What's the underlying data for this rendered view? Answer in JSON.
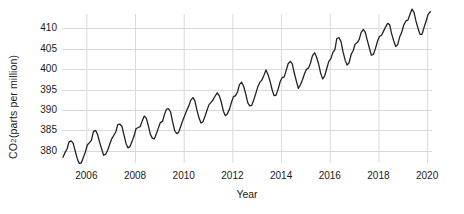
{
  "chart_data": {
    "type": "line",
    "title": "",
    "xlabel": "Year",
    "ylabel_text": "CO",
    "ylabel_sub": "2",
    "ylabel_rest": " (parts per million)",
    "ylabel_full": "CO2 (parts per million)",
    "xlim": [
      2005.0,
      2020.2
    ],
    "ylim": [
      377.0,
      413.5
    ],
    "xticks": [
      2006,
      2008,
      2010,
      2012,
      2014,
      2016,
      2018,
      2020
    ],
    "xtick_labels": [
      "2006",
      "2008",
      "2010",
      "2012",
      "2014",
      "2016",
      "2018",
      "2020"
    ],
    "yticks": [
      380,
      385,
      390,
      395,
      400,
      405,
      410
    ],
    "ytick_labels": [
      "380",
      "385",
      "390",
      "395",
      "400",
      "405",
      "410"
    ],
    "grid": true,
    "grid_color": "#d9d9d9",
    "line_color": "#222222",
    "line_width": 1.3,
    "legend": null,
    "series": [
      {
        "name": "Atmospheric CO2 monthly mean",
        "x": [
          2005.04,
          2005.13,
          2005.21,
          2005.29,
          2005.38,
          2005.46,
          2005.54,
          2005.63,
          2005.71,
          2005.79,
          2005.88,
          2005.96,
          2006.04,
          2006.13,
          2006.21,
          2006.29,
          2006.38,
          2006.46,
          2006.54,
          2006.63,
          2006.71,
          2006.79,
          2006.88,
          2006.96,
          2007.04,
          2007.13,
          2007.21,
          2007.29,
          2007.38,
          2007.46,
          2007.54,
          2007.63,
          2007.71,
          2007.79,
          2007.88,
          2007.96,
          2008.04,
          2008.13,
          2008.21,
          2008.29,
          2008.38,
          2008.46,
          2008.54,
          2008.63,
          2008.71,
          2008.79,
          2008.88,
          2008.96,
          2009.04,
          2009.13,
          2009.21,
          2009.29,
          2009.38,
          2009.46,
          2009.54,
          2009.63,
          2009.71,
          2009.79,
          2009.88,
          2009.96,
          2010.04,
          2010.13,
          2010.21,
          2010.29,
          2010.38,
          2010.46,
          2010.54,
          2010.63,
          2010.71,
          2010.79,
          2010.88,
          2010.96,
          2011.04,
          2011.13,
          2011.21,
          2011.29,
          2011.38,
          2011.46,
          2011.54,
          2011.63,
          2011.71,
          2011.79,
          2011.88,
          2011.96,
          2012.04,
          2012.13,
          2012.21,
          2012.29,
          2012.38,
          2012.46,
          2012.54,
          2012.63,
          2012.71,
          2012.79,
          2012.88,
          2012.96,
          2013.04,
          2013.13,
          2013.21,
          2013.29,
          2013.38,
          2013.46,
          2013.54,
          2013.63,
          2013.71,
          2013.79,
          2013.88,
          2013.96,
          2014.04,
          2014.13,
          2014.21,
          2014.29,
          2014.38,
          2014.46,
          2014.54,
          2014.63,
          2014.71,
          2014.79,
          2014.88,
          2014.96,
          2015.04,
          2015.13,
          2015.21,
          2015.29,
          2015.38,
          2015.46,
          2015.54,
          2015.63,
          2015.71,
          2015.79,
          2015.88,
          2015.96,
          2016.04,
          2016.13,
          2016.21,
          2016.29,
          2016.38,
          2016.46,
          2016.54,
          2016.63,
          2016.71,
          2016.79,
          2016.88,
          2016.96,
          2017.04,
          2017.13,
          2017.21,
          2017.29,
          2017.38,
          2017.46,
          2017.54,
          2017.63,
          2017.71,
          2017.79,
          2017.88,
          2017.96,
          2018.04,
          2018.13,
          2018.21,
          2018.29,
          2018.38,
          2018.46,
          2018.54,
          2018.63,
          2018.71,
          2018.79,
          2018.88,
          2018.96,
          2019.04,
          2019.13,
          2019.21,
          2019.29,
          2019.38,
          2019.46,
          2019.54,
          2019.63,
          2019.71,
          2019.79,
          2019.88,
          2019.96,
          2020.04,
          2020.13
        ],
        "y": [
          378.4,
          379.6,
          380.5,
          382.2,
          382.4,
          381.8,
          380.0,
          378.0,
          376.9,
          377.0,
          378.4,
          379.7,
          381.4,
          382.0,
          382.6,
          384.7,
          385.0,
          384.0,
          382.2,
          380.4,
          378.9,
          379.1,
          380.2,
          381.6,
          382.9,
          383.8,
          384.6,
          386.4,
          386.5,
          386.0,
          384.0,
          381.8,
          380.7,
          381.0,
          382.3,
          383.6,
          385.4,
          385.7,
          385.9,
          387.2,
          388.5,
          388.0,
          386.3,
          384.0,
          383.1,
          382.9,
          384.2,
          385.6,
          386.9,
          387.2,
          388.9,
          390.2,
          390.3,
          389.5,
          387.2,
          384.9,
          384.2,
          384.5,
          386.0,
          387.4,
          388.6,
          390.0,
          391.0,
          392.4,
          393.0,
          392.2,
          390.0,
          388.0,
          386.8,
          387.1,
          388.5,
          390.0,
          391.3,
          391.9,
          392.5,
          393.4,
          394.2,
          393.5,
          392.0,
          389.7,
          388.6,
          389.0,
          390.2,
          391.8,
          393.2,
          393.5,
          394.4,
          396.2,
          396.8,
          395.8,
          394.1,
          391.8,
          391.0,
          391.1,
          392.5,
          394.0,
          395.6,
          396.8,
          397.3,
          398.4,
          399.8,
          398.7,
          397.2,
          395.0,
          393.5,
          393.6,
          395.1,
          396.9,
          397.9,
          398.1,
          399.7,
          401.3,
          401.9,
          401.3,
          399.1,
          397.0,
          395.3,
          396.1,
          397.4,
          398.8,
          399.9,
          400.3,
          401.5,
          403.3,
          404.0,
          402.9,
          401.3,
          398.9,
          397.6,
          398.3,
          400.2,
          401.9,
          402.5,
          404.1,
          404.8,
          407.5,
          407.7,
          406.8,
          404.4,
          402.2,
          401.0,
          401.5,
          403.6,
          404.5,
          406.1,
          406.5,
          407.3,
          409.0,
          409.7,
          409.0,
          407.1,
          405.1,
          403.4,
          403.6,
          405.1,
          406.8,
          408.0,
          408.3,
          409.3,
          410.3,
          411.2,
          410.9,
          408.7,
          406.9,
          405.5,
          406.0,
          408.0,
          409.1,
          410.8,
          411.8,
          412.0,
          413.3,
          414.7,
          413.9,
          411.8,
          409.9,
          408.5,
          408.5,
          410.3,
          411.8,
          413.4,
          414.1
        ]
      }
    ]
  }
}
